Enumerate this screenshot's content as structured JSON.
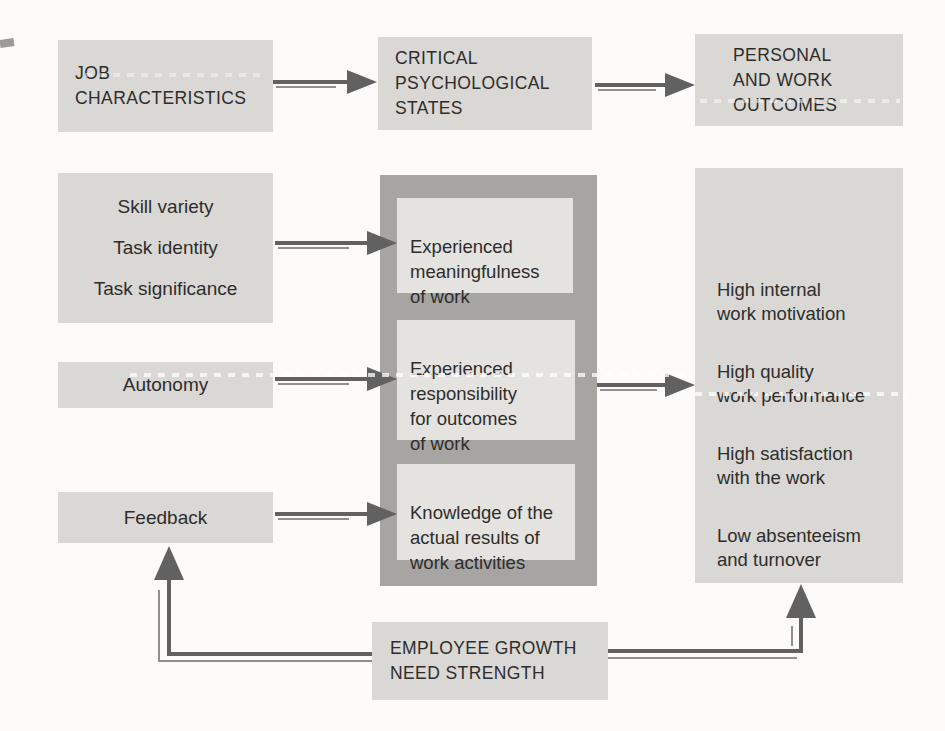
{
  "headers": {
    "job": "JOB\nCHARACTERISTICS",
    "psych": "CRITICAL\nPSYCHOLOGICAL\nSTATES",
    "outcomes": "PERSONAL\nAND WORK\nOUTCOMES"
  },
  "job_characteristics": {
    "core_dimensions": [
      "Skill variety",
      "Task identity",
      "Task significance"
    ],
    "autonomy": "Autonomy",
    "feedback": "Feedback"
  },
  "psychological_states": {
    "meaningfulness": "Experienced\nmeaningfulness\nof work",
    "responsibility": "Experienced\nresponsibility\nfor outcomes\nof work",
    "knowledge": "Knowledge of the\nactual results of\nwork activities"
  },
  "outcomes": {
    "item1": "High internal\nwork motivation",
    "item2": "High quality\nwork performance",
    "item3": "High satisfaction\nwith the work",
    "item4": "Low absenteeism\nand turnover"
  },
  "moderator": "EMPLOYEE GROWTH\nNEED STRENGTH",
  "colors": {
    "page-bg": "#fcfbf9",
    "box-bg": "#d9d8d5",
    "inner-box-bg": "#e4e3e0",
    "dark-panel-bg": "#a6a5a2",
    "arrow": "#616161",
    "arrow-light": "#8f8f8f",
    "text": "#2e2d2b"
  }
}
